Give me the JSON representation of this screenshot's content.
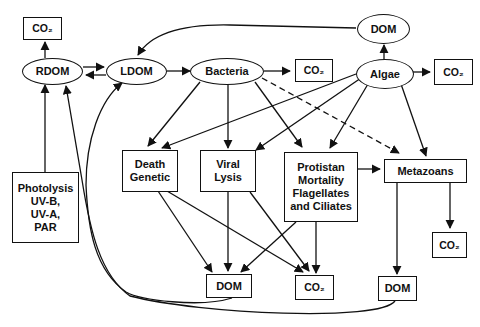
{
  "diagram": {
    "nodes": {
      "co2_rdom": {
        "label": "CO₂"
      },
      "rdom": {
        "label": "RDOM"
      },
      "ldom": {
        "label": "LDOM"
      },
      "bacteria": {
        "label": "Bacteria"
      },
      "co2_bacteria": {
        "label": "CO₂"
      },
      "dom_algae": {
        "label": "DOM"
      },
      "algae": {
        "label": "Algae"
      },
      "co2_algae": {
        "label": "CO₂"
      },
      "photolysis": {
        "label": "Photolysis\nUV-B,\nUV-A,\nPAR"
      },
      "death_genetic": {
        "label": "Death\nGenetic"
      },
      "viral_lysis": {
        "label": "Viral\nLysis"
      },
      "protistan": {
        "label": "Protistan\nMortality\nFlagellates\nand Ciliates"
      },
      "metazoans": {
        "label": "Metazoans"
      },
      "co2_metazoans": {
        "label": "CO₂"
      },
      "dom_bottom_mid": {
        "label": "DOM"
      },
      "co2_bottom": {
        "label": "CO₂"
      },
      "dom_bottom_right": {
        "label": "DOM"
      }
    },
    "edges": [
      {
        "from": "RDOM",
        "to": "CO₂"
      },
      {
        "from": "RDOM",
        "to": "LDOM"
      },
      {
        "from": "LDOM",
        "to": "RDOM"
      },
      {
        "from": "LDOM",
        "to": "Bacteria"
      },
      {
        "from": "Bacteria",
        "to": "CO₂"
      },
      {
        "from": "Algae",
        "to": "CO₂"
      },
      {
        "from": "Algae",
        "to": "DOM"
      },
      {
        "from": "DOM",
        "to": "LDOM"
      },
      {
        "from": "Photolysis",
        "to": "RDOM"
      },
      {
        "from": "Bacteria",
        "to": "Death Genetic"
      },
      {
        "from": "Bacteria",
        "to": "Viral Lysis"
      },
      {
        "from": "Bacteria",
        "to": "Protistan Mortality"
      },
      {
        "from": "Bacteria",
        "to": "Metazoans",
        "style": "dashed"
      },
      {
        "from": "Algae",
        "to": "Death Genetic"
      },
      {
        "from": "Algae",
        "to": "Viral Lysis"
      },
      {
        "from": "Algae",
        "to": "Protistan Mortality"
      },
      {
        "from": "Algae",
        "to": "Metazoans"
      },
      {
        "from": "Protistan Mortality",
        "to": "Metazoans"
      },
      {
        "from": "Death Genetic",
        "to": "DOM"
      },
      {
        "from": "Death Genetic",
        "to": "CO₂"
      },
      {
        "from": "Viral Lysis",
        "to": "DOM"
      },
      {
        "from": "Viral Lysis",
        "to": "CO₂"
      },
      {
        "from": "Protistan Mortality",
        "to": "DOM"
      },
      {
        "from": "Protistan Mortality",
        "to": "CO₂"
      },
      {
        "from": "Metazoans",
        "to": "DOM"
      },
      {
        "from": "Metazoans",
        "to": "CO₂"
      },
      {
        "from": "DOM (bottom)",
        "to": "RDOM"
      },
      {
        "from": "DOM (bottom)",
        "to": "LDOM"
      }
    ]
  }
}
